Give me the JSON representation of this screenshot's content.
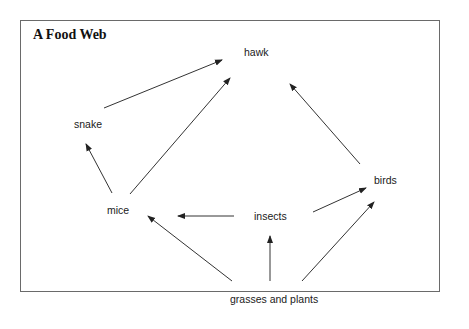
{
  "diagram": {
    "title": "A Food Web",
    "nodes": [
      {
        "id": "hawk",
        "label": "hawk",
        "x": 244,
        "y": 47
      },
      {
        "id": "snake",
        "label": "snake",
        "x": 74,
        "y": 119
      },
      {
        "id": "birds",
        "label": "birds",
        "x": 374,
        "y": 175
      },
      {
        "id": "mice",
        "label": "mice",
        "x": 107,
        "y": 205
      },
      {
        "id": "insects",
        "label": "insects",
        "x": 254,
        "y": 211
      },
      {
        "id": "grasses",
        "label": "grasses and plants",
        "x": 230,
        "y": 294
      }
    ],
    "edges": [
      {
        "from": "snake",
        "to": "hawk",
        "x1": 104,
        "y1": 108,
        "x2": 222,
        "y2": 60
      },
      {
        "from": "mice",
        "to": "hawk",
        "x1": 130,
        "y1": 194,
        "x2": 230,
        "y2": 78
      },
      {
        "from": "mice",
        "to": "snake",
        "x1": 112,
        "y1": 193,
        "x2": 86,
        "y2": 144
      },
      {
        "from": "birds",
        "to": "hawk",
        "x1": 360,
        "y1": 164,
        "x2": 290,
        "y2": 84
      },
      {
        "from": "insects",
        "to": "mice",
        "x1": 234,
        "y1": 216,
        "x2": 178,
        "y2": 216
      },
      {
        "from": "insects",
        "to": "birds",
        "x1": 313,
        "y1": 212,
        "x2": 366,
        "y2": 188
      },
      {
        "from": "grasses",
        "to": "mice",
        "x1": 232,
        "y1": 281,
        "x2": 148,
        "y2": 216
      },
      {
        "from": "grasses",
        "to": "insects",
        "x1": 270,
        "y1": 281,
        "x2": 270,
        "y2": 236
      },
      {
        "from": "grasses",
        "to": "birds",
        "x1": 302,
        "y1": 281,
        "x2": 374,
        "y2": 202
      }
    ],
    "colors": {
      "frame": "#6a6a6a",
      "arrow": "#333333",
      "text": "#1a1a1a"
    }
  }
}
